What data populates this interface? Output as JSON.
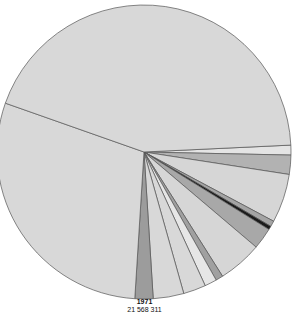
{
  "chart_data": {
    "type": "pie",
    "title": "1971",
    "subtitle": "21 568 311",
    "unit": "degrees (estimated slice angles)",
    "start_angle_deg": 357.3,
    "direction": "clockwise",
    "slices": [
      {
        "label": "",
        "value": 3.9,
        "color": "#e4e4e4"
      },
      {
        "label": "",
        "value": 7.6,
        "color": "#b2b2b2"
      },
      {
        "label": "",
        "value": 19.3,
        "color": "#d6d6d6"
      },
      {
        "label": "",
        "value": 2.3,
        "color": "#a4a4a4"
      },
      {
        "label": "",
        "value": 1.4,
        "color": "#1a1a1a"
      },
      {
        "label": "",
        "value": 8.5,
        "color": "#a8a8a8"
      },
      {
        "label": "",
        "value": 17.4,
        "color": "#d6d6d6"
      },
      {
        "label": "",
        "value": 2.9,
        "color": "#a0a0a0"
      },
      {
        "label": "",
        "value": 4.8,
        "color": "#e6e6e6"
      },
      {
        "label": "",
        "value": 8.9,
        "color": "#d8d8d8"
      },
      {
        "label": "",
        "value": 12.1,
        "color": "#d8d8d8"
      },
      {
        "label": "",
        "value": 7.2,
        "color": "#9c9c9c"
      },
      {
        "label": "",
        "value": 105.8,
        "color": "#d8d8d8"
      },
      {
        "label": "",
        "value": 157.9,
        "color": "#d8d8d8"
      }
    ],
    "center": [
      144,
      152
    ],
    "radius": 147,
    "stroke": "#555555"
  },
  "caption": {
    "year": "1971",
    "total": "21 568 311"
  }
}
